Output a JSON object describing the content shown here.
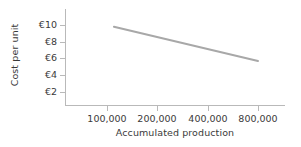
{
  "chart_data": {
    "type": "line",
    "title": "",
    "subtitle": "",
    "xlabel": "Accumulated production",
    "ylabel": "Cost per unit",
    "x_scale": "log",
    "x_ticks": [
      100000,
      200000,
      400000,
      800000
    ],
    "x_tick_labels": [
      "100,000",
      "200,000",
      "400,000",
      "800,000"
    ],
    "y_ticks": [
      2,
      4,
      6,
      8,
      10
    ],
    "y_tick_labels": [
      "€2",
      "€4",
      "€6",
      "€8",
      "€10"
    ],
    "ylim": [
      0,
      11
    ],
    "grid": false,
    "legend": false,
    "currency_symbol": "€",
    "series": [
      {
        "name": "Cost per unit",
        "color": "#a8a8a8",
        "line_width": 2,
        "x": [
          110000,
          800000
        ],
        "y": [
          9.8,
          5.7
        ],
        "points": [
          {
            "x": 110000,
            "y": 9.8,
            "label": "€9.80"
          },
          {
            "x": 800000,
            "y": 5.7,
            "label": "€5.70"
          }
        ]
      }
    ],
    "annotations": []
  },
  "style": {
    "background": "#ffffff",
    "axis_color": "#b9b9b9",
    "text_color": "#3a3a3a",
    "line_color": "#a8a8a8"
  },
  "icons": {
    "y_axis_title_name": "y-axis-title",
    "x_axis_title_name": "x-axis-title"
  }
}
